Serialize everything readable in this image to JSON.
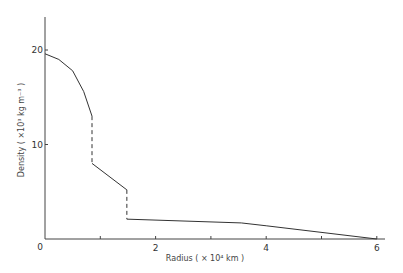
{
  "chart_data": {
    "type": "line",
    "title": "",
    "xlabel": "Radius ( × 10⁴ km )",
    "ylabel": "Density ( ×10³ kg m⁻³ )",
    "xlim": [
      0,
      6
    ],
    "ylim": [
      0,
      23
    ],
    "x_ticks": [
      0,
      1,
      2,
      3,
      4,
      5,
      6
    ],
    "x_tick_labels": [
      "0",
      "",
      "2",
      "",
      "4",
      "",
      "6"
    ],
    "y_ticks": [
      10,
      20
    ],
    "y_tick_labels": [
      "10",
      "20"
    ],
    "origin_label": "0",
    "grid": false,
    "legend": null,
    "series": [
      {
        "name": "core",
        "style": "solid",
        "points": [
          [
            0,
            19.6
          ],
          [
            0.25,
            19.0
          ],
          [
            0.5,
            17.8
          ],
          [
            0.7,
            15.6
          ],
          [
            0.85,
            13.0
          ]
        ]
      },
      {
        "name": "discontinuity-1",
        "style": "dashed",
        "points": [
          [
            0.85,
            13.0
          ],
          [
            0.85,
            8.0
          ]
        ]
      },
      {
        "name": "mantle",
        "style": "solid",
        "points": [
          [
            0.85,
            8.0
          ],
          [
            1.48,
            5.2
          ]
        ]
      },
      {
        "name": "discontinuity-2",
        "style": "dashed",
        "points": [
          [
            1.48,
            5.2
          ],
          [
            1.48,
            2.1
          ]
        ]
      },
      {
        "name": "envelope",
        "style": "solid",
        "points": [
          [
            1.48,
            2.1
          ],
          [
            3.55,
            1.7
          ],
          [
            4.0,
            1.4
          ],
          [
            6.0,
            0.0
          ]
        ]
      }
    ]
  }
}
